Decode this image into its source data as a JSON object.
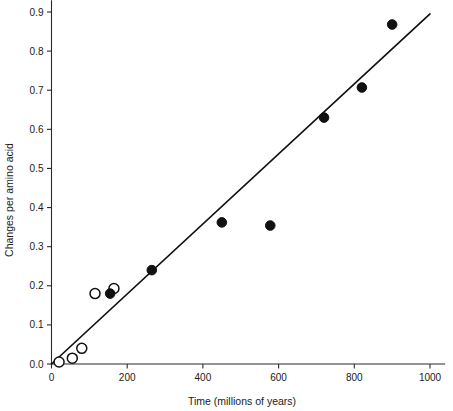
{
  "chart_data": {
    "type": "scatter",
    "title": "",
    "xlabel": "Time (millions of years)",
    "ylabel": "Changes per amino acid",
    "xlim": [
      0,
      1040
    ],
    "ylim": [
      0,
      0.93
    ],
    "xticks": [
      0,
      200,
      400,
      600,
      800,
      1000
    ],
    "xtick_labels": [
      "0",
      "200",
      "400",
      "600",
      "800",
      "1000"
    ],
    "yticks": [
      0.0,
      0.1,
      0.2,
      0.3,
      0.4,
      0.5,
      0.6,
      0.7,
      0.8,
      0.9
    ],
    "ytick_labels": [
      "0.0",
      "0.1",
      "0.2",
      "0.3",
      "0.4",
      "0.5",
      "0.6",
      "0.7",
      "0.8",
      "0.9"
    ],
    "grid": false,
    "legend": "none",
    "series": [
      {
        "name": "open-circles",
        "marker": "open-circle",
        "color": "#111111",
        "points": [
          {
            "x": 20,
            "y": 0.005
          },
          {
            "x": 55,
            "y": 0.015
          },
          {
            "x": 80,
            "y": 0.04
          },
          {
            "x": 115,
            "y": 0.18
          },
          {
            "x": 165,
            "y": 0.193
          }
        ]
      },
      {
        "name": "filled-circles",
        "marker": "filled-circle",
        "color": "#111111",
        "points": [
          {
            "x": 155,
            "y": 0.18
          },
          {
            "x": 265,
            "y": 0.24
          },
          {
            "x": 450,
            "y": 0.362
          },
          {
            "x": 578,
            "y": 0.354
          },
          {
            "x": 720,
            "y": 0.63
          },
          {
            "x": 820,
            "y": 0.707
          },
          {
            "x": 900,
            "y": 0.868
          }
        ]
      }
    ],
    "trend_line": {
      "name": "regression-line",
      "x_start": 0,
      "y_start": 0.0,
      "x_end": 1000,
      "y_end": 0.895,
      "color": "#111111"
    }
  }
}
